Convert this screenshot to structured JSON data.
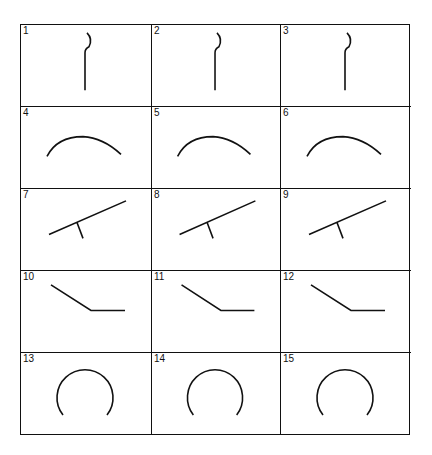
{
  "grid": {
    "rows": 5,
    "cols": 3,
    "cells": [
      {
        "number": "1",
        "shape": "hook-line"
      },
      {
        "number": "2",
        "shape": "hook-line"
      },
      {
        "number": "3",
        "shape": "hook-line"
      },
      {
        "number": "4",
        "shape": "arc"
      },
      {
        "number": "5",
        "shape": "arc"
      },
      {
        "number": "6",
        "shape": "arc"
      },
      {
        "number": "7",
        "shape": "seesaw"
      },
      {
        "number": "8",
        "shape": "seesaw"
      },
      {
        "number": "9",
        "shape": "seesaw"
      },
      {
        "number": "10",
        "shape": "bent-line"
      },
      {
        "number": "11",
        "shape": "bent-line"
      },
      {
        "number": "12",
        "shape": "bent-line"
      },
      {
        "number": "13",
        "shape": "open-circle"
      },
      {
        "number": "14",
        "shape": "open-circle"
      },
      {
        "number": "15",
        "shape": "open-circle"
      }
    ]
  },
  "colors": {
    "line": "#111111",
    "background": "#ffffff"
  }
}
